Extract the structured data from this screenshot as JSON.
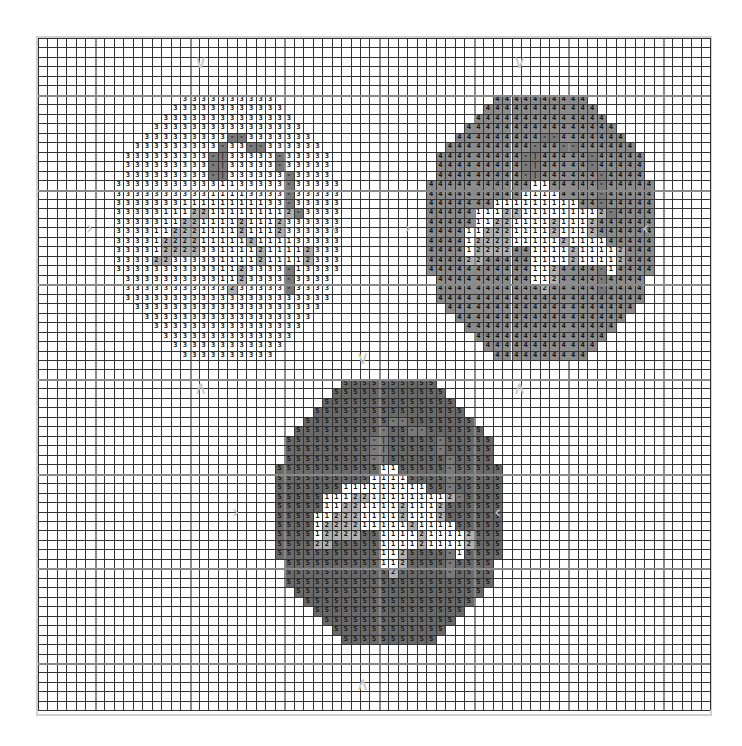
{
  "pattern": {
    "grid": {
      "cols": 71,
      "rows": 71,
      "cell_px": 9.47,
      "major_every": 10,
      "major_offset": 6
    },
    "colors": {
      "symbol_3_bg": "#ffffff",
      "symbol_4_bg": "#8c8c8c",
      "symbol_5_bg": "#6a6a6a",
      "symbol_1_bg": "#ffffff",
      "symbol_2_bg": "#b0b0b0",
      "stripe_bg": "#7a7a7a",
      "grid_line": "#333333",
      "major_line": "#8a8a8a"
    },
    "egg_shape_row_spans": [
      [
        7,
        16
      ],
      [
        6,
        17
      ],
      [
        5,
        18
      ],
      [
        4,
        19
      ],
      [
        3,
        20
      ],
      [
        2,
        21
      ],
      [
        1,
        22
      ],
      [
        1,
        22
      ],
      [
        1,
        22
      ],
      [
        0,
        23
      ],
      [
        0,
        23
      ],
      [
        0,
        23
      ],
      [
        0,
        23
      ],
      [
        0,
        23
      ],
      [
        0,
        23
      ],
      [
        0,
        23
      ],
      [
        0,
        23
      ],
      [
        0,
        23
      ],
      [
        0,
        23
      ],
      [
        1,
        22
      ],
      [
        1,
        22
      ],
      [
        1,
        22
      ],
      [
        2,
        21
      ],
      [
        3,
        20
      ],
      [
        4,
        19
      ],
      [
        5,
        18
      ],
      [
        6,
        17
      ],
      [
        7,
        16
      ]
    ],
    "egg_detail_rows": [
      "........................",
      "........................",
      "........................",
      "........................",
      "............--..........",
      "...........-..--........",
      "..........-|.....-......",
      "..........-|.....-......",
      "..........-|......-.....",
      "...........11.....-.....",
      "..........1111....-.....",
      ".......111111111..-.....",
      ".....11122111111112-....",
      ".....1122111121112......",
      "....11222111121112......",
      "....122221111121111.....",
      "....12222..1111211112...",
      "....22.....1111211112...",
      "...........112....-1....",
      "...........112....-.....",
      "............2.....-.....",
      "........................",
      "........................",
      "........................",
      "........................",
      "........................",
      "........................",
      "........................"
    ],
    "eggs": [
      {
        "name": "egg-symbol-3",
        "fill_symbol": "3",
        "col": 8,
        "row": 6,
        "bg": "#ffffff",
        "fg": "#111111"
      },
      {
        "name": "egg-symbol-4",
        "fill_symbol": "4",
        "col": 41,
        "row": 6,
        "bg": "#8c8c8c",
        "fg": "#111111"
      },
      {
        "name": "egg-symbol-5",
        "fill_symbol": "5",
        "col": 25,
        "row": 36,
        "bg": "#6a6a6a",
        "fg": "#111111"
      }
    ],
    "center_arrows": [
      {
        "dir": "down",
        "glyph": "∨",
        "x": 200,
        "y": 62
      },
      {
        "dir": "down",
        "glyph": "∨",
        "x": 519,
        "y": 62
      },
      {
        "dir": "right",
        "glyph": "›",
        "x": 92,
        "y": 228
      },
      {
        "dir": "left",
        "glyph": "‹",
        "x": 337,
        "y": 228
      },
      {
        "dir": "right",
        "glyph": "›",
        "x": 410,
        "y": 228
      },
      {
        "dir": "left",
        "glyph": "‹",
        "x": 648,
        "y": 228
      },
      {
        "dir": "up",
        "glyph": "∧",
        "x": 200,
        "y": 388
      },
      {
        "dir": "up",
        "glyph": "∧",
        "x": 519,
        "y": 388
      },
      {
        "dir": "down",
        "glyph": "∨",
        "x": 362,
        "y": 358
      },
      {
        "dir": "right",
        "glyph": "›",
        "x": 238,
        "y": 512
      },
      {
        "dir": "left",
        "glyph": "‹",
        "x": 500,
        "y": 512
      },
      {
        "dir": "up",
        "glyph": "∧",
        "x": 362,
        "y": 684
      }
    ]
  }
}
